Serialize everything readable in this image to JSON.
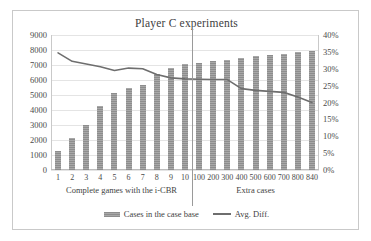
{
  "chart_data": {
    "type": "bar",
    "title": "Player C experiments",
    "xlabel": "",
    "ylabel": "",
    "grid": true,
    "legend_position": "bottom",
    "categories": [
      "1",
      "2",
      "3",
      "4",
      "5",
      "6",
      "7",
      "8",
      "9",
      "10",
      "100",
      "200",
      "300",
      "400",
      "500",
      "600",
      "700",
      "800",
      "840"
    ],
    "group_labels": [
      {
        "label": "Complete games with the i-CBR",
        "categories": [
          "1",
          "2",
          "3",
          "4",
          "5",
          "6",
          "7",
          "8",
          "9",
          "10"
        ]
      },
      {
        "label": "Extra cases",
        "categories": [
          "100",
          "200",
          "300",
          "400",
          "500",
          "600",
          "700",
          "800",
          "840"
        ]
      }
    ],
    "series": [
      {
        "name": "Cases in the case base",
        "type": "bar",
        "axis": "left",
        "color": "#9a9a9a",
        "values": [
          1250,
          2120,
          2980,
          4300,
          5130,
          5500,
          5680,
          6400,
          6800,
          7050,
          7150,
          7250,
          7350,
          7480,
          7570,
          7650,
          7750,
          7880,
          7920
        ]
      },
      {
        "name": "Avg. Diff.",
        "type": "line",
        "axis": "right",
        "color": "#6e6e6e",
        "values": [
          34.7,
          32.2,
          31.4,
          30.6,
          29.5,
          30.2,
          30.0,
          28.3,
          27.3,
          27.0,
          26.9,
          26.8,
          26.8,
          24.1,
          23.6,
          23.3,
          23.0,
          21.6,
          20.0
        ]
      }
    ],
    "y_axis_left": {
      "min": 0,
      "max": 9000,
      "step": 1000,
      "ticks": [
        "0",
        "1000",
        "2000",
        "3000",
        "4000",
        "5000",
        "6000",
        "7000",
        "8000",
        "9000"
      ]
    },
    "y_axis_right": {
      "min": 0,
      "max": 40,
      "step": 5,
      "ticks": [
        "0%",
        "5%",
        "10%",
        "15%",
        "20%",
        "25%",
        "30%",
        "35%",
        "40%"
      ]
    },
    "legend": [
      {
        "label": "Cases in the case base",
        "marker": "bar-swatch"
      },
      {
        "label": "Avg. Diff.",
        "marker": "line-swatch"
      }
    ]
  }
}
